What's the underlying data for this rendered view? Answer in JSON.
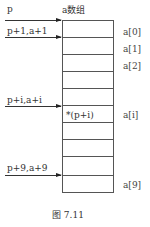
{
  "title": "a数组",
  "pointers": [
    {
      "label": "p",
      "target_index": 0
    },
    {
      "label": "p+1,a+1",
      "target_index": 1
    },
    {
      "label": "p+i,a+i",
      "target_index": 5
    },
    {
      "label": "p+9,a+9",
      "target_index": 9
    }
  ],
  "cells": [
    "",
    "",
    "",
    "",
    "",
    "*(p+i)",
    "",
    "",
    "",
    ""
  ],
  "index_labels": [
    "a[0]",
    "a[1]",
    "a[2]",
    "a[i]",
    "a[9]"
  ],
  "caption": "图    7.11"
}
